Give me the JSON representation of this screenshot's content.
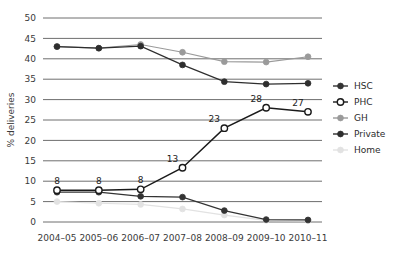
{
  "chart_data": {
    "type": "line",
    "title": "",
    "xlabel": "",
    "ylabel": "% deliveries",
    "categories": [
      "2004–05",
      "2005–06",
      "2006–07",
      "2007–08",
      "2008–09",
      "2009–10",
      "2010–11"
    ],
    "ylim": [
      0,
      50
    ],
    "ytick_values": [
      "0",
      "5",
      "10",
      "15",
      "20",
      "25",
      "30",
      "35",
      "40",
      "45",
      "50"
    ],
    "grid": true,
    "legend_position": "right",
    "series": [
      {
        "name": "HSC",
        "color": "#333333",
        "marker": "filled-circle",
        "values": [
          7.3,
          7.3,
          6.3,
          6.1,
          2.8,
          0.6,
          0.5
        ]
      },
      {
        "name": "PHC",
        "color": "#1a1a1a",
        "marker": "open-circle",
        "values": [
          7.8,
          7.8,
          8.0,
          13.3,
          23.0,
          28.0,
          27.0
        ],
        "point_labels": [
          "8",
          "8",
          "8",
          "13",
          "23",
          "28",
          "27"
        ]
      },
      {
        "name": "GH",
        "color": "#9a9a9a",
        "marker": "filled-circle",
        "values": [
          43.0,
          42.6,
          43.5,
          41.6,
          39.3,
          39.2,
          40.5
        ]
      },
      {
        "name": "Private",
        "color": "#2e2e2e",
        "marker": "filled-circle",
        "values": [
          43.0,
          42.6,
          43.1,
          38.5,
          34.4,
          33.8,
          34.0
        ]
      },
      {
        "name": "Home",
        "color": "#e2e2e2",
        "marker": "filled-circle",
        "values": [
          5.0,
          4.6,
          4.3,
          3.2,
          1.7,
          0.4,
          0.3
        ]
      }
    ]
  },
  "legend": {
    "items": [
      {
        "label": "HSC"
      },
      {
        "label": "PHC"
      },
      {
        "label": "GH"
      },
      {
        "label": "Private"
      },
      {
        "label": "Home"
      }
    ]
  }
}
